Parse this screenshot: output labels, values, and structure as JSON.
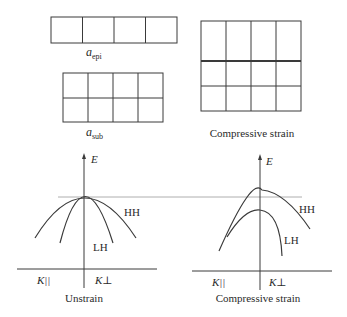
{
  "lattice": {
    "epi": {
      "label_main": "a",
      "label_sub": "epi",
      "rows": 1,
      "cols": 4
    },
    "sub": {
      "label_main": "a",
      "label_sub": "sub",
      "rows": 2,
      "cols": 4
    },
    "strained": {
      "caption": "Compressive strain",
      "rows": 3,
      "cols": 4
    }
  },
  "band_diagrams": [
    {
      "id": "unstrain",
      "caption": "Unstrain",
      "y_axis_label": "E",
      "x_left_label": "K||",
      "x_right_label": "K⊥",
      "curves": [
        {
          "name": "HH",
          "label": "HH"
        },
        {
          "name": "LH",
          "label": "LH"
        }
      ]
    },
    {
      "id": "compressive",
      "caption": "Compressive strain",
      "y_axis_label": "E",
      "x_left_label": "K||",
      "x_right_label": "K⊥",
      "curves": [
        {
          "name": "HH",
          "label": "HH"
        },
        {
          "name": "LH",
          "label": "LH"
        }
      ]
    }
  ],
  "colors": {
    "line": "#3a3a3a",
    "reference_line": "#9a9a9a",
    "text": "#2a2a2a"
  }
}
